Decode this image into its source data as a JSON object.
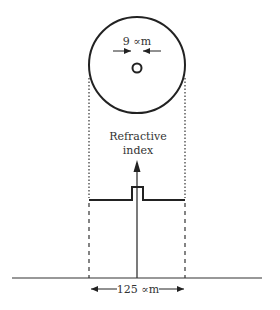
{
  "diagram": {
    "core_diameter_label": "9 ∝m",
    "cladding_diameter_label": "125 ∝m",
    "axis_label_line1": "Refractive",
    "axis_label_line2": "index",
    "colors": {
      "stroke": "#222222",
      "text": "#333333",
      "background": "#ffffff"
    }
  }
}
